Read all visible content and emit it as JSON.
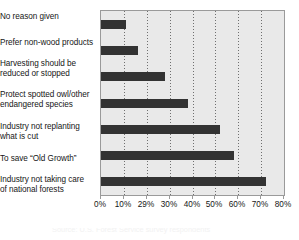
{
  "chart_data": {
    "type": "bar",
    "orientation": "horizontal",
    "title": "",
    "xlabel": "",
    "ylabel": "",
    "categories": [
      "No reason given",
      "Prefer non-wood products",
      "Harvesting should be\nreduced or stopped",
      "Protect spotted owl/other\nendangered species",
      "Industry not replanting\nwhat is cut",
      "To save “Old Growth”",
      "Industry not taking care\nof national forests"
    ],
    "values": [
      11,
      16,
      28,
      38,
      52,
      58,
      72
    ],
    "value_unit": "%",
    "xlim": [
      0,
      80
    ],
    "tick_values": [
      0,
      10,
      20,
      30,
      40,
      50,
      60,
      70,
      80
    ],
    "tick_labels": [
      "0%",
      "10%",
      "29%",
      "30%",
      "40%",
      "50%",
      "60%",
      "70%",
      "80%"
    ],
    "grid": true,
    "grid_axis": "x",
    "grid_style": "dotted",
    "legend": false,
    "bar_color": "#333333",
    "plot_background": "#e9e9e9",
    "gridline_color": "#6f6f6f",
    "axis_color": "#9a9a9a"
  },
  "caption": {
    "text": "Source: U.S. Forest Service survey respondents"
  }
}
